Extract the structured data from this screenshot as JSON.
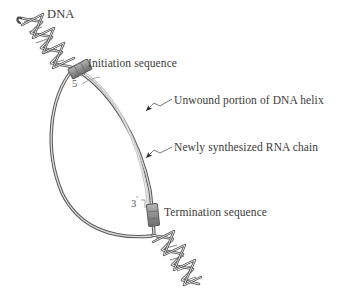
{
  "figure": {
    "kind": "biology-diagram",
    "width": 339,
    "height": 300,
    "background_color": "#ffffff"
  },
  "labels": {
    "dna": "DNA",
    "initiation_sequence": "Initiation sequence",
    "unwound_portion": "Unwound portion of DNA helix",
    "rna_chain": "Newly synthesized RNA chain",
    "termination_sequence": "Termination sequence",
    "five_prime": "5",
    "five_prime_mark": "′",
    "three_prime": "3",
    "three_prime_mark": "′"
  },
  "colors": {
    "text": "#3b3b3b",
    "prime_text": "#5a5a5a",
    "dna_strand_outline": "#4a4a4a",
    "dna_strand_fill": "#d8d8d8",
    "rna_chain": "#c9c9c9",
    "sequence_box_fill": "#9a9a9a",
    "sequence_box_outline": "#5a5a5a",
    "leader_line": "#6a6a6a",
    "background": "#ffffff"
  },
  "elements": {
    "top_helix": {
      "name": "double-stranded DNA helix (upstream)",
      "turns": 5,
      "orientation": "diagonal, upper-left to lower-right"
    },
    "bottom_helix": {
      "name": "double-stranded DNA helix (downstream)",
      "turns": 5,
      "orientation": "diagonal, upper-left to lower-right"
    },
    "bubble": {
      "name": "unwound transcription bubble",
      "shape": "lens formed by two separated DNA strands"
    },
    "rna": {
      "name": "newly synthesized RNA chain",
      "from": "5",
      "to": "3"
    },
    "boxes": [
      {
        "name": "initiation-sequence-box"
      },
      {
        "name": "termination-sequence-box"
      }
    ],
    "leader_lines": [
      {
        "target": "unwound_portion",
        "style": "kinked with arrowhead"
      },
      {
        "target": "rna_chain",
        "style": "kinked with arrowhead"
      }
    ]
  }
}
